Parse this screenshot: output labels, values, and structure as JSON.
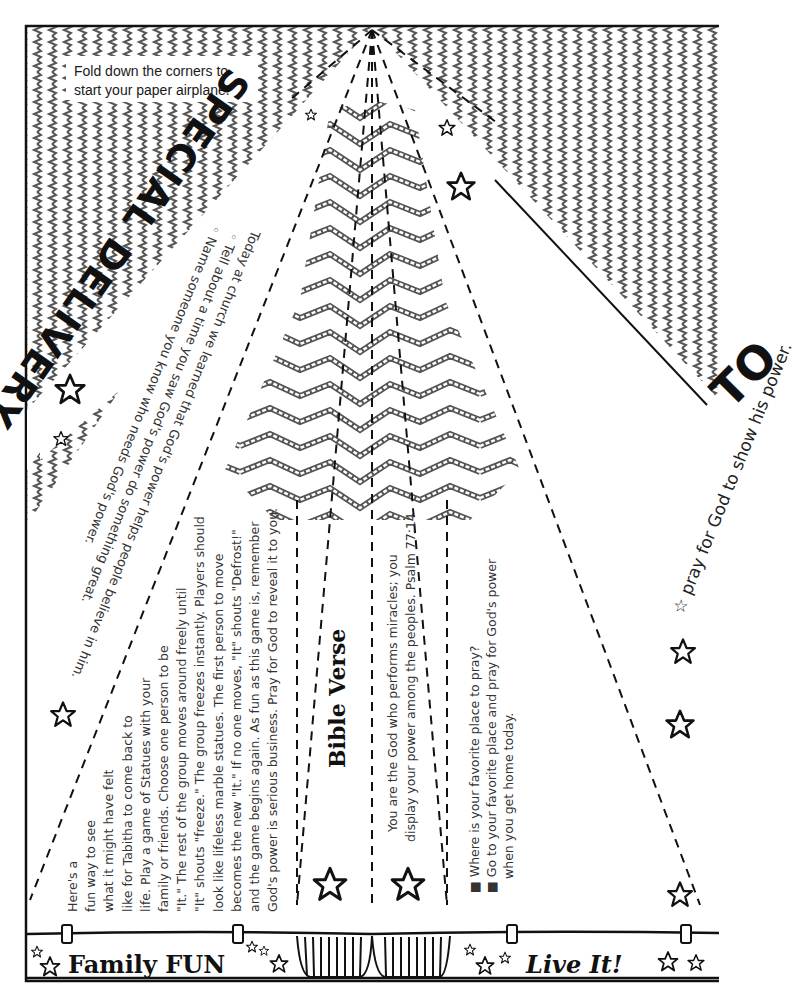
{
  "instruction_note": {
    "line1": "Fold down the corners to",
    "line2": "start your paper airplane."
  },
  "titles": {
    "special_delivery": "SPECIAL DELIVERY",
    "to": "TO"
  },
  "today_at_church": {
    "lines": [
      "Today at church we learned that God's power helps people believe in him.",
      "◦ Tell about a time you saw God's power do something great.",
      "◦ Name someone you know who needs God's power."
    ]
  },
  "to_prayer": "☆ pray for God to show his power.",
  "family_fun": {
    "heading": "Family FUN",
    "lines": [
      "Here's a",
      "fun way to see",
      "what it might have felt",
      "like for Tabitha to come back to",
      "life. Play a game of Statues with your",
      "family or friends. Choose one person to be",
      "\"It.\" The rest of the group moves around freely until",
      "\"It\" shouts \"freeze.\" The group freezes instantly. Players should",
      "look like lifeless marble statues. The first person to move",
      "becomes the new \"It.\" If no one moves, \"It\" shouts \"Defrost!\"",
      "and the game begins again. As fun as this game is, remember",
      "God's power is serious business. Pray for God to reveal it to you."
    ]
  },
  "bible_verse": {
    "heading": "Bible Verse",
    "line1": "You are the God who performs miracles; you",
    "line2": "display your power among the peoples. Psalm 77:14"
  },
  "live_it": {
    "heading": "Live It!",
    "items": [
      "■ Where is your favorite place to pray?",
      "■ Go to your favorite place and pray for God's power",
      "   when you get home today."
    ]
  },
  "colors": {
    "ink": "#111111",
    "wave": "#555555",
    "text": "#333333",
    "paper": "#ffffff"
  }
}
